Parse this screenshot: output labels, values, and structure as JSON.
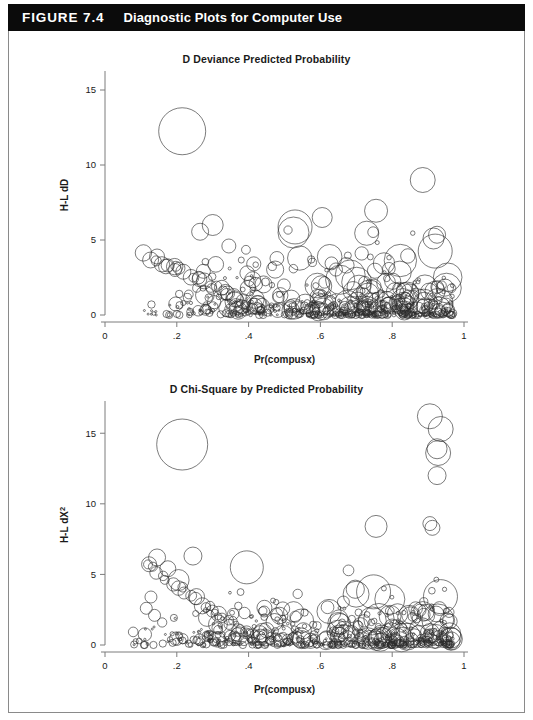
{
  "header": {
    "figure_number": "FIGURE 7.4",
    "caption": "Diagnostic Plots for Computer Use",
    "background_color": "#0b0b0b",
    "text_color": "#ffffff"
  },
  "chart_data": [
    {
      "id": "deviance",
      "type": "scatter",
      "title": "D Deviance Predicted Probability",
      "xlabel": "Pr(compusx)",
      "ylabel": "H-L dD",
      "xlim": [
        0,
        1
      ],
      "ylim": [
        0,
        16
      ],
      "xticks": [
        0,
        0.2,
        0.4,
        0.6,
        0.8,
        1
      ],
      "xticklabels": [
        "0",
        ".2",
        ".4",
        ".6",
        ".8",
        "1"
      ],
      "yticks": [
        0,
        5,
        10,
        15
      ],
      "yticklabels": [
        "0",
        "5",
        "10",
        "15"
      ],
      "grid": false,
      "legend": "none",
      "marker": "open-circle-variable-size",
      "seed": 20240714,
      "n_points": 520,
      "size_range": [
        1.2,
        13.0
      ],
      "notable_points": [
        {
          "x": 0.215,
          "y": 12.25,
          "r": 23.5,
          "note": "large isolated outlier"
        },
        {
          "x": 0.885,
          "y": 9.0,
          "r": 12.5,
          "note": "isolated high point"
        },
        {
          "x": 0.755,
          "y": 6.95,
          "r": 11.5
        },
        {
          "x": 0.605,
          "y": 6.5,
          "r": 10.0
        },
        {
          "x": 0.525,
          "y": 5.5,
          "r": 15.5
        },
        {
          "x": 0.3,
          "y": 6.0,
          "r": 10.5
        },
        {
          "x": 0.265,
          "y": 5.55,
          "r": 8.5
        },
        {
          "x": 0.345,
          "y": 4.6,
          "r": 7.0
        },
        {
          "x": 0.925,
          "y": 5.35,
          "r": 8.5
        },
        {
          "x": 0.915,
          "y": 5.1,
          "r": 10.5
        },
        {
          "x": 0.195,
          "y": 3.0,
          "r": 6.5
        },
        {
          "x": 0.145,
          "y": 3.9,
          "r": 7.5
        }
      ]
    },
    {
      "id": "chi-square",
      "type": "scatter",
      "title": "D Chi-Square by Predicted Probability",
      "xlabel": "Pr(compusx)",
      "ylabel": "H-L dX²",
      "xlim": [
        0,
        1
      ],
      "ylim": [
        0,
        17
      ],
      "xticks": [
        0,
        0.2,
        0.4,
        0.6,
        0.8,
        1
      ],
      "xticklabels": [
        "0",
        ".2",
        ".4",
        ".6",
        ".8",
        "1"
      ],
      "yticks": [
        0,
        5,
        10,
        15
      ],
      "yticklabels": [
        "0",
        "5",
        "10",
        "15"
      ],
      "grid": false,
      "legend": "none",
      "marker": "open-circle-variable-size",
      "seed": 777311,
      "n_points": 540,
      "size_range": [
        1.2,
        13.0
      ],
      "notable_points": [
        {
          "x": 0.215,
          "y": 14.2,
          "r": 25.5,
          "note": "large isolated outlier"
        },
        {
          "x": 0.905,
          "y": 16.2,
          "r": 12.5
        },
        {
          "x": 0.935,
          "y": 15.3,
          "r": 12.5
        },
        {
          "x": 0.925,
          "y": 13.9,
          "r": 10.0
        },
        {
          "x": 0.928,
          "y": 13.6,
          "r": 12.5
        },
        {
          "x": 0.925,
          "y": 12.0,
          "r": 9.0
        },
        {
          "x": 0.755,
          "y": 8.4,
          "r": 11.0
        },
        {
          "x": 0.905,
          "y": 8.6,
          "r": 7.0
        },
        {
          "x": 0.912,
          "y": 8.3,
          "r": 7.5
        },
        {
          "x": 0.395,
          "y": 5.5,
          "r": 16.5
        },
        {
          "x": 0.175,
          "y": 5.4,
          "r": 8.0
        },
        {
          "x": 0.145,
          "y": 6.2,
          "r": 8.5
        },
        {
          "x": 0.245,
          "y": 6.3,
          "r": 9.0
        },
        {
          "x": 0.205,
          "y": 4.6,
          "r": 10.5
        },
        {
          "x": 0.128,
          "y": 3.4,
          "r": 6.0
        },
        {
          "x": 0.115,
          "y": 2.6,
          "r": 6.0
        },
        {
          "x": 0.138,
          "y": 2.1,
          "r": 6.0
        }
      ]
    }
  ]
}
